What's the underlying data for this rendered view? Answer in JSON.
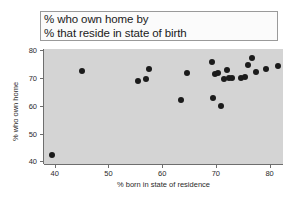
{
  "chart_data": {
    "type": "scatter",
    "title": "% who own home by % that reside in state of birth",
    "title_lines": [
      "% who own home by",
      "% that reside in state of birth"
    ],
    "xlabel": "% born in state of residence",
    "ylabel": "% who own home",
    "xlim": [
      38.0,
      82.5
    ],
    "ylim": [
      39.0,
      80.5
    ],
    "xticks": [
      40,
      50,
      60,
      70,
      80
    ],
    "yticks": [
      40,
      50,
      60,
      70,
      80
    ],
    "grid": false,
    "legend": null,
    "marker_color": "#1b1b1b",
    "panel_color": "#d4d4d4",
    "points": [
      {
        "x": 39.5,
        "y": 42.4
      },
      {
        "x": 45.0,
        "y": 72.6
      },
      {
        "x": 55.5,
        "y": 69.1
      },
      {
        "x": 57.0,
        "y": 69.6
      },
      {
        "x": 57.6,
        "y": 73.2
      },
      {
        "x": 63.6,
        "y": 62.2
      },
      {
        "x": 64.6,
        "y": 71.8
      },
      {
        "x": 69.2,
        "y": 75.8
      },
      {
        "x": 69.4,
        "y": 62.8
      },
      {
        "x": 69.8,
        "y": 71.3
      },
      {
        "x": 70.4,
        "y": 72.0
      },
      {
        "x": 70.9,
        "y": 60.1
      },
      {
        "x": 71.6,
        "y": 69.6
      },
      {
        "x": 72.1,
        "y": 72.8
      },
      {
        "x": 72.4,
        "y": 69.9
      },
      {
        "x": 73.0,
        "y": 70.0
      },
      {
        "x": 74.7,
        "y": 70.2
      },
      {
        "x": 75.4,
        "y": 70.3
      },
      {
        "x": 76.0,
        "y": 74.6
      },
      {
        "x": 76.7,
        "y": 77.3
      },
      {
        "x": 77.4,
        "y": 72.3
      },
      {
        "x": 79.3,
        "y": 73.3
      },
      {
        "x": 81.6,
        "y": 74.4
      }
    ]
  }
}
